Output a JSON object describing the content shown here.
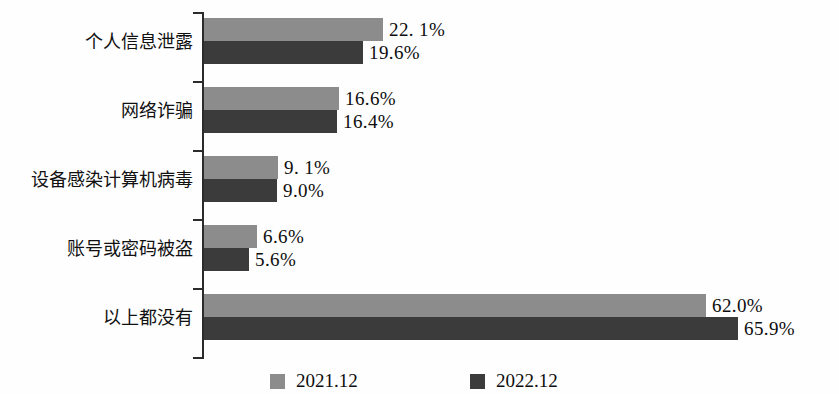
{
  "chart_data": {
    "type": "bar",
    "orientation": "horizontal",
    "title": "",
    "subtitle": "",
    "xlabel": "",
    "ylabel": "",
    "grid": false,
    "axis_visible": true,
    "xlim": [
      0,
      70
    ],
    "categories": [
      "个人信息泄露",
      "网络诈骗",
      "设备感染计算机病毒",
      "账号或密码被盗",
      "以上都没有"
    ],
    "series": [
      {
        "name": "2021.12",
        "color": "#8c8c8c",
        "values": [
          22.1,
          16.6,
          9.1,
          6.6,
          62.0
        ],
        "labels": [
          "22. 1%",
          "16.6%",
          "9. 1%",
          "6.6%",
          "62.0%"
        ]
      },
      {
        "name": "2022.12",
        "color": "#3b3b3b",
        "values": [
          19.6,
          16.4,
          9.0,
          5.6,
          65.9
        ],
        "labels": [
          "19.6%",
          "16.4%",
          "9.0%",
          "5.6%",
          "65.9%"
        ]
      }
    ],
    "legend": {
      "position": "bottom",
      "entries": [
        {
          "label": "2021.12",
          "color": "#8c8c8c"
        },
        {
          "label": "2022.12",
          "color": "#3b3b3b"
        }
      ]
    }
  },
  "axis": {
    "tick_count": 6
  }
}
